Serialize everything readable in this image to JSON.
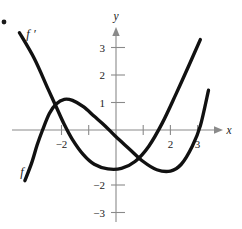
{
  "figure": {
    "bullet_marker": "•",
    "axes": {
      "x_axis_label": "x",
      "y_axis_label": "y",
      "x_ticks": [
        {
          "value": -2,
          "label": "−2"
        },
        {
          "value": -1,
          "label": ""
        },
        {
          "value": 1,
          "label": ""
        },
        {
          "value": 2,
          "label": "2"
        },
        {
          "value": 3,
          "label": "3"
        }
      ],
      "y_ticks": [
        {
          "value": 3,
          "label": "3"
        },
        {
          "value": 2,
          "label": "2"
        },
        {
          "value": 1,
          "label": "1"
        },
        {
          "value": -2,
          "label": "−2"
        },
        {
          "value": -3,
          "label": "−3"
        }
      ]
    },
    "curve_labels": {
      "f_prime": "f ′",
      "f": "f"
    },
    "colors": {
      "curve": "#111111",
      "axis": "#8a8a8a",
      "text": "#1a1a1a",
      "background": "#ffffff"
    }
  },
  "chart_data": {
    "type": "line",
    "title": "",
    "xlabel": "x",
    "ylabel": "y",
    "xlim": [
      -3.6,
      3.6
    ],
    "ylim": [
      -3.6,
      3.6
    ],
    "grid": false,
    "legend": "inline-curve-labels",
    "x_ticks": [
      -2,
      2,
      3
    ],
    "y_ticks": [
      3,
      2,
      1,
      -2,
      -3
    ],
    "series": [
      {
        "name": "f ′",
        "label_position": {
          "x": -2.9,
          "y": 3.5
        },
        "description": "Steep curve entering from upper-left, falling through a crossing near x = -2.4 at y = 1.1, continuing down, reaching a minimum near (2.0, -1.5), then rising steeply off the top-right.",
        "points": [
          {
            "x": -3.55,
            "y": 3.55
          },
          {
            "x": -3.0,
            "y": 2.6
          },
          {
            "x": -2.5,
            "y": 1.5
          },
          {
            "x": -2.2,
            "y": 0.85
          },
          {
            "x": -1.9,
            "y": 0.2
          },
          {
            "x": -1.6,
            "y": -0.35
          },
          {
            "x": -1.2,
            "y": -0.9
          },
          {
            "x": -0.8,
            "y": -1.25
          },
          {
            "x": -0.3,
            "y": -1.42
          },
          {
            "x": 0.2,
            "y": -1.4
          },
          {
            "x": 0.7,
            "y": -1.15
          },
          {
            "x": 1.2,
            "y": -0.6
          },
          {
            "x": 1.7,
            "y": 0.25
          },
          {
            "x": 2.2,
            "y": 1.3
          },
          {
            "x": 2.7,
            "y": 2.4
          },
          {
            "x": 3.1,
            "y": 3.3
          }
        ]
      },
      {
        "name": "f",
        "label_position": {
          "x": -3.1,
          "y": -1.55
        },
        "description": "Cubic curve rising steeply from lower-left, crossing the x-axis near x = -2.7, local maximum about (-1.9, 1.1), falling through the origin region, local minimum about (2.0, -1.5), then rising to the right edge.",
        "points": [
          {
            "x": -3.35,
            "y": -1.85
          },
          {
            "x": -3.1,
            "y": -1.2
          },
          {
            "x": -2.9,
            "y": -0.55
          },
          {
            "x": -2.7,
            "y": 0.0
          },
          {
            "x": -2.45,
            "y": 0.6
          },
          {
            "x": -2.2,
            "y": 0.95
          },
          {
            "x": -1.9,
            "y": 1.12
          },
          {
            "x": -1.6,
            "y": 1.08
          },
          {
            "x": -1.2,
            "y": 0.85
          },
          {
            "x": -0.8,
            "y": 0.5
          },
          {
            "x": -0.4,
            "y": 0.15
          },
          {
            "x": 0.0,
            "y": -0.25
          },
          {
            "x": 0.5,
            "y": -0.7
          },
          {
            "x": 1.0,
            "y": -1.15
          },
          {
            "x": 1.5,
            "y": -1.45
          },
          {
            "x": 2.0,
            "y": -1.5
          },
          {
            "x": 2.4,
            "y": -1.25
          },
          {
            "x": 2.8,
            "y": -0.6
          },
          {
            "x": 3.1,
            "y": 0.15
          },
          {
            "x": 3.4,
            "y": 1.45
          }
        ]
      }
    ]
  }
}
